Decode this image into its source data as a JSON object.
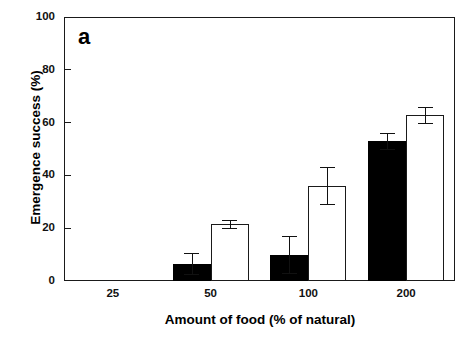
{
  "chart_data": {
    "type": "bar",
    "title": "",
    "panel_label": "a",
    "xlabel": "Amount of food (% of natural)",
    "ylabel": "Emergence success (%)",
    "categories": [
      "25",
      "50",
      "100",
      "200"
    ],
    "ylim": [
      0,
      100
    ],
    "yticks": [
      0,
      20,
      40,
      60,
      80,
      100
    ],
    "ytick_labels": [
      "0",
      "20",
      "40",
      "60",
      "80",
      "100"
    ],
    "grid": false,
    "legend": "none",
    "series": [
      {
        "name": "filled",
        "fill": "#000000",
        "values": [
          0,
          6.5,
          10,
          53
        ],
        "errors": [
          0,
          4,
          7,
          3
        ]
      },
      {
        "name": "open",
        "fill": "#ffffff",
        "values": [
          0,
          21.5,
          36,
          63
        ],
        "errors": [
          0,
          1.5,
          7,
          3
        ]
      }
    ]
  },
  "figure": {
    "background": "#ffffff",
    "axis_color": "#1a1a1a"
  }
}
